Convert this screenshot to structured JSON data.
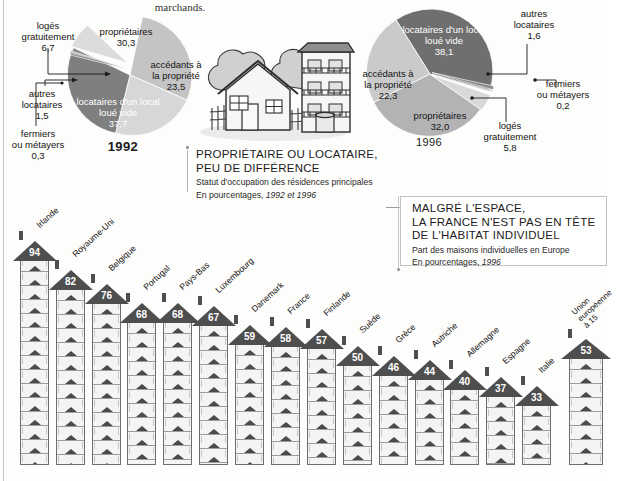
{
  "top_note": "marchands.",
  "panel1": {
    "title_line1": "PROPRIÉTAIRE OU LOCATAIRE,",
    "title_line2": "PEU DE DIFFÉRENCE",
    "subtitle_line1": "Statut d'occupation des résidences principales",
    "subtitle_line2_prefix": "En pourcentages, ",
    "subtitle_line2_italic": "1992 et 1996"
  },
  "panel2": {
    "title_line1": "MALGRÉ L'ESPACE,",
    "title_line2": "LA FRANCE N'EST PAS EN TÊTE",
    "title_line3": "DE L'HABITAT INDIVIDUEL",
    "subtitle_line1": "Part des maisons individuelles en Europe",
    "subtitle_line2_prefix": "En pourcentages, ",
    "subtitle_line2_italic": "1996"
  },
  "chart_data": [
    {
      "type": "pie",
      "title": "1992",
      "ylabel": "",
      "xlabel": "",
      "unit": "%",
      "categories": [
        "propriétaires",
        "accédants à la propriété",
        "locataires d'un local loué vide",
        "autres locataires",
        "fermiers ou métayers",
        "logés gratuitement"
      ],
      "values": [
        30.3,
        23.5,
        37.7,
        1.5,
        0.3,
        6.7
      ],
      "value_labels": [
        "30,3",
        "23,5",
        "37,7",
        "1,5",
        "0,3",
        "6,7"
      ],
      "colors": [
        "#bdbdbd",
        "#d2d2d2",
        "#7d7d7d",
        "#8e8e8e",
        "#9e9e9e",
        "#d8d8d8"
      ]
    },
    {
      "type": "pie",
      "title": "1996",
      "ylabel": "",
      "xlabel": "",
      "unit": "%",
      "categories": [
        "locataires d'un local loué vide",
        "accédants à la propriété",
        "propriétaires",
        "logés gratuitement",
        "fermiers ou métayers",
        "autres locataires"
      ],
      "values": [
        38.1,
        22.3,
        32.0,
        5.8,
        0.2,
        1.6
      ],
      "value_labels": [
        "38,1",
        "22,3",
        "32,0",
        "5,8",
        "0,2",
        "1,6"
      ],
      "colors": [
        "#6f6f6f",
        "#c9c9c9",
        "#b5b5b5",
        "#d6d6d6",
        "#a0a0a0",
        "#8a8a8a"
      ]
    },
    {
      "type": "bar",
      "title": "Part des maisons individuelles en Europe",
      "xlabel": "",
      "ylabel": "",
      "unit": "%",
      "ylim": [
        0,
        100
      ],
      "categories": [
        "Irlande",
        "Royaume-Uni",
        "Belgique",
        "Portugal",
        "Pays-Bas",
        "Luxembourg",
        "Danemark",
        "France",
        "Finlande",
        "Suède",
        "Grèce",
        "Autriche",
        "Allemagne",
        "Espagne",
        "Italie",
        "Union européenne à 15"
      ],
      "values": [
        94,
        82,
        76,
        68,
        68,
        67,
        59,
        58,
        57,
        50,
        46,
        44,
        40,
        37,
        33,
        53
      ],
      "value_labels": [
        "94",
        "82",
        "76",
        "68",
        "68",
        "67",
        "59",
        "58",
        "57",
        "50",
        "46",
        "44",
        "40",
        "37",
        "33",
        "53"
      ]
    }
  ],
  "pie1_labels": [
    {
      "name": "logés gratuitement",
      "value": "6,7"
    },
    {
      "name": "propriétaires",
      "value": "30,3"
    },
    {
      "name": "accédants à la propriété",
      "value": "23,5"
    },
    {
      "name": "autres locataires",
      "value": "1,5"
    },
    {
      "name": "fermiers ou métayers",
      "value": "0,3"
    },
    {
      "name": "locataires d'un local loué vide",
      "value": "37,7"
    }
  ],
  "pie1_year": "1992",
  "pie2_year": "1996",
  "pie2_labels": [
    {
      "name": "locataires d'un local loué vide",
      "value": "38,1"
    },
    {
      "name": "autres locataires",
      "value": "1,6"
    },
    {
      "name": "accédants à la propriété",
      "value": "22,3"
    },
    {
      "name": "fermiers ou métayers",
      "value": "0,2"
    },
    {
      "name": "propriétaires",
      "value": "32,0"
    },
    {
      "name": "logés gratuitement",
      "value": "5,8"
    }
  ],
  "texts": {
    "p1_l1a": "logés",
    "p1_l1b": "gratuitement",
    "p1_l1v": "6,7",
    "p1_l2a": "propriétaires",
    "p1_l2v": "30,3",
    "p1_l3a": "accédants à",
    "p1_l3b": "la propriété",
    "p1_l3v": "23,5",
    "p1_l4a": "autres",
    "p1_l4b": "locataires",
    "p1_l4v": "1,5",
    "p1_l5a": "fermiers",
    "p1_l5b": "ou métayers",
    "p1_l5v": "0,3",
    "p1_l6a": "locataires d'un local",
    "p1_l6b": "loué vide",
    "p1_l6v": "37,7",
    "p2_l1a": "locataires d'un local",
    "p2_l1b": "loué vide",
    "p2_l1v": "38,1",
    "p2_l2a": "autres",
    "p2_l2b": "locataires",
    "p2_l2v": "1,6",
    "p2_l3a": "accédants à",
    "p2_l3b": "la propriété",
    "p2_l3v": "22,3",
    "p2_l4a": "fermiers",
    "p2_l4b": "ou métayers",
    "p2_l4v": "0,2",
    "p2_l5a": "propriétaires",
    "p2_l5v": "32,0",
    "p2_l6a": "logés",
    "p2_l6b": "gratuitement",
    "p2_l6v": "5,8"
  }
}
